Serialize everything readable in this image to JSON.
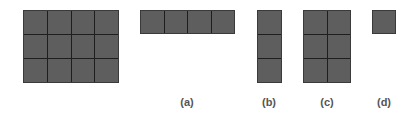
{
  "figure": {
    "main": {
      "rows": 3,
      "cols": 4
    },
    "panels": [
      {
        "label": "(a)",
        "rows": 1,
        "cols": 4
      },
      {
        "label": "(b)",
        "rows": 3,
        "cols": 1
      },
      {
        "label": "(c)",
        "rows": 3,
        "cols": 2
      },
      {
        "label": "(d)",
        "rows": 1,
        "cols": 1
      }
    ],
    "colors": {
      "cell": "#5e5e5e",
      "line": "#1e1e1e",
      "label": "#555555"
    }
  }
}
